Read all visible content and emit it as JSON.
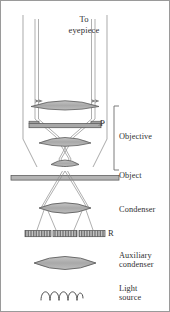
{
  "figure": {
    "frame_color": "#9a9a9a",
    "background": "#ffffff"
  },
  "labels": {
    "to_eyepiece": "To\neyepiece",
    "phase_plate": "P",
    "objective": "Objective",
    "object": "Object",
    "condenser": "Condenser",
    "annular_ring": "R",
    "auxiliary_condenser": "Auxiliary\ncondenser",
    "light_source": "Light\nsource"
  },
  "colors": {
    "lens_fill": "#b0b0b0",
    "lens_stroke": "#5a5a5a",
    "ray_stroke": "#8c8c8c",
    "barrel_stroke": "#9b9b9b",
    "plate_fill": "#a8a8a8",
    "text": "#2f2f2f",
    "hatch_stroke": "#4a4a4a"
  },
  "components": [
    {
      "name": "ray-bundle-upper-left",
      "type": "ray",
      "label": null
    },
    {
      "name": "ray-bundle-upper-right",
      "type": "ray",
      "label": null
    },
    {
      "name": "objective-lens-top",
      "type": "lens",
      "label": "Objective"
    },
    {
      "name": "phase-plate",
      "type": "plate",
      "label": "P"
    },
    {
      "name": "objective-lens-middle",
      "type": "lens",
      "label": "Objective"
    },
    {
      "name": "objective-lens-front",
      "type": "lens",
      "label": "Objective"
    },
    {
      "name": "object-slide",
      "type": "plane",
      "label": "Object"
    },
    {
      "name": "condenser-lens",
      "type": "lens",
      "label": "Condenser"
    },
    {
      "name": "annular-ring-diaphragm",
      "type": "diaphragm",
      "label": "R",
      "segments": 3
    },
    {
      "name": "auxiliary-condenser-lens",
      "type": "lens",
      "label": "Auxiliary condenser"
    },
    {
      "name": "lamp-filament-coil",
      "type": "filament",
      "label": "Light source",
      "turns": 4
    }
  ]
}
